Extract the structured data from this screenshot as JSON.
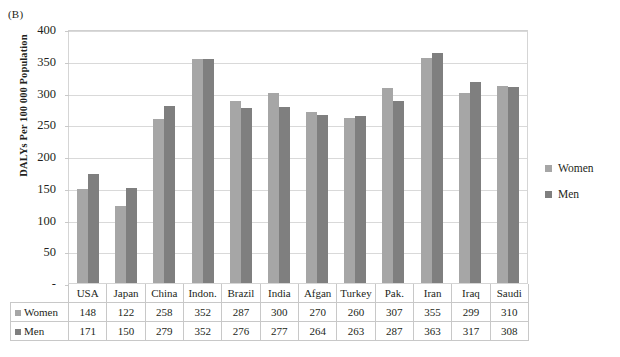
{
  "panel_label": "(B)",
  "legend": {
    "position": "right",
    "items": [
      {
        "label": "Women",
        "color": "#a6a6a6"
      },
      {
        "label": "Men",
        "color": "#7f7f7f"
      }
    ]
  },
  "table": {
    "row_labels": [
      "Women",
      "Men"
    ],
    "headers": [
      "USA",
      "Japan",
      "China",
      "Indon.",
      "Brazil",
      "India",
      "Afgan",
      "Turkey",
      "Pak.",
      "Iran",
      "Iraq",
      "Saudi"
    ],
    "rows": [
      [
        "148",
        "122",
        "258",
        "352",
        "287",
        "300",
        "270",
        "260",
        "307",
        "355",
        "299",
        "310"
      ],
      [
        "171",
        "150",
        "279",
        "352",
        "276",
        "277",
        "264",
        "263",
        "287",
        "363",
        "317",
        "308"
      ]
    ]
  },
  "chart_data": {
    "type": "bar",
    "title": "",
    "xlabel": "",
    "ylabel": "DALYs Per 100 000 Population",
    "ylim": [
      0,
      400
    ],
    "yticks": [
      400,
      350,
      300,
      250,
      200,
      150,
      100,
      50,
      0
    ],
    "ytick_labels": [
      "400",
      "350",
      "300",
      "250",
      "200",
      "150",
      "100",
      "50",
      "-"
    ],
    "grid": true,
    "legend_position": "right",
    "categories": [
      "USA",
      "Japan",
      "China",
      "Indon.",
      "Brazil",
      "India",
      "Afgan",
      "Turkey",
      "Pak.",
      "Iran",
      "Iraq",
      "Saudi"
    ],
    "series": [
      {
        "name": "Women",
        "color": "#a6a6a6",
        "values": [
          148,
          122,
          258,
          352,
          287,
          300,
          270,
          260,
          307,
          355,
          299,
          310
        ]
      },
      {
        "name": "Men",
        "color": "#7f7f7f",
        "values": [
          171,
          150,
          279,
          352,
          276,
          277,
          264,
          263,
          287,
          363,
          317,
          308
        ]
      }
    ]
  }
}
